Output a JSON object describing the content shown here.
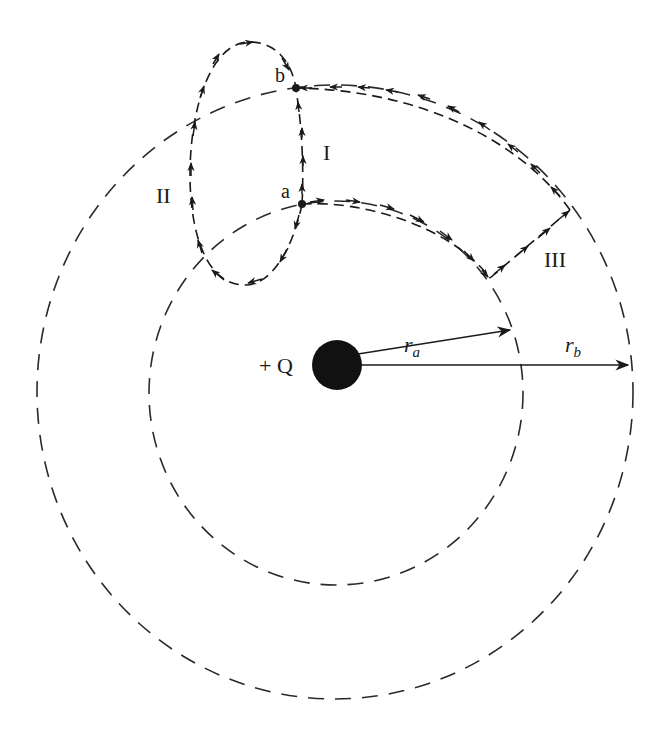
{
  "diagram": {
    "charge": {
      "label": "+ Q",
      "color": "#1a1a1a"
    },
    "points": {
      "a": "a",
      "b": "b"
    },
    "paths": {
      "I": "I",
      "II": "II",
      "III": "III"
    },
    "radii": {
      "ra": {
        "symbol": "r",
        "subscript": "a"
      },
      "rb": {
        "symbol": "r",
        "subscript": "b"
      }
    },
    "equipotentials": [
      "inner circle through a (radius r_a)",
      "outer circle through b (radius r_b)"
    ]
  }
}
